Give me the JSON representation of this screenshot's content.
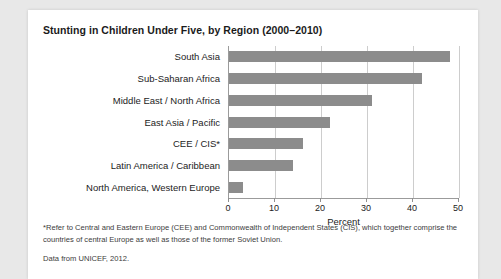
{
  "chart_title": "Stunting in Children Under Five, by Region (2000–2010)",
  "notes": {
    "footnote": "*Refer to Central and Eastern Europe (CEE) and Commonwealth of Independent States (CIS), which together comprise the countries of central Europe as well as those of the former Soviet Union.",
    "source": "Data from UNICEF, 2012."
  },
  "colors": {
    "bar": "#8c8c8c",
    "axis": "#9b9b9b",
    "grid": "#cdcdcd",
    "card": "#ffffff",
    "page_background": "#e8e8e8"
  },
  "chart_data": {
    "type": "bar",
    "orientation": "horizontal",
    "title": "Stunting in Children Under Five, by Region (2000–2010)",
    "xlabel": "Percent",
    "ylabel": "",
    "xlim": [
      0,
      50
    ],
    "xticks": [
      0,
      10,
      20,
      30,
      40,
      50
    ],
    "xtick_labels": [
      "0",
      "10",
      "20",
      "30",
      "40",
      "50"
    ],
    "grid": true,
    "grid_axis": "x",
    "legend": false,
    "categories": [
      "South Asia",
      "Sub-Saharan Africa",
      "Middle East / North Africa",
      "East Asia / Pacific",
      "CEE / CIS*",
      "Latin America / Caribbean",
      "North America, Western Europe"
    ],
    "values": [
      48,
      42,
      31,
      22,
      16,
      14,
      3
    ],
    "series": [
      {
        "name": "Percent stunted",
        "values": [
          48,
          42,
          31,
          22,
          16,
          14,
          3
        ]
      }
    ]
  }
}
